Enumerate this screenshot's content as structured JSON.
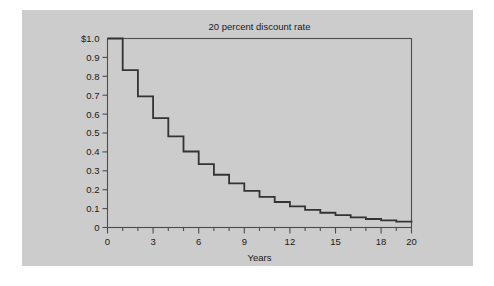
{
  "figure": {
    "background_color": "#ffffff",
    "panel_color": "#cccccc",
    "line_color": "#333333",
    "axis_color": "#4d4d4d",
    "text_color": "#1a1a1a"
  },
  "chart_data": {
    "type": "line",
    "title": "20 percent discount rate",
    "xlabel": "Years",
    "ylabel": "",
    "xlim": [
      0,
      20
    ],
    "ylim": [
      0,
      1.0
    ],
    "grid": false,
    "legend": null,
    "step_style": "post",
    "discount_rate_percent": 20,
    "x_ticks_major": [
      0,
      3,
      6,
      9,
      12,
      15,
      18,
      20
    ],
    "x_tick_labels": [
      "0",
      "3",
      "6",
      "9",
      "12",
      "15",
      "18",
      "20"
    ],
    "x_ticks_minor": [
      1,
      2,
      4,
      5,
      7,
      8,
      10,
      11,
      13,
      14,
      16,
      17,
      19
    ],
    "y_ticks": [
      1.0,
      0.9,
      0.8,
      0.7,
      0.6,
      0.5,
      0.4,
      0.3,
      0.2,
      0.1,
      0
    ],
    "y_tick_labels": [
      "$1.0",
      "0.9",
      "0.8",
      "0.7",
      "0.6",
      "0.5",
      "0.4",
      "0.3",
      "0.2",
      "0.1",
      "0"
    ],
    "x": [
      0,
      1,
      2,
      3,
      4,
      5,
      6,
      7,
      8,
      9,
      10,
      11,
      12,
      13,
      14,
      15,
      16,
      17,
      18,
      19,
      20
    ],
    "values": [
      1.0,
      0.833,
      0.694,
      0.579,
      0.482,
      0.402,
      0.335,
      0.279,
      0.233,
      0.194,
      0.162,
      0.135,
      0.112,
      0.093,
      0.078,
      0.065,
      0.054,
      0.045,
      0.038,
      0.031,
      0.026
    ],
    "series": [
      {
        "name": "Present value of $1",
        "values": [
          1.0,
          0.833,
          0.694,
          0.579,
          0.482,
          0.402,
          0.335,
          0.279,
          0.233,
          0.194,
          0.162,
          0.135,
          0.112,
          0.093,
          0.078,
          0.065,
          0.054,
          0.045,
          0.038,
          0.031,
          0.026
        ]
      }
    ]
  }
}
